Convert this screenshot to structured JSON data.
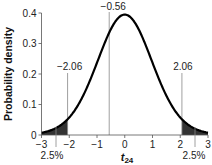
{
  "chart_data": {
    "type": "line",
    "title": "",
    "xlabel": "t",
    "xlabel_sub": "24",
    "ylabel": "Probability density",
    "xlim": [
      -3,
      3
    ],
    "ylim": [
      0,
      0.4
    ],
    "xticks": [
      -3,
      -2,
      -1,
      0,
      1,
      2,
      3
    ],
    "xtick_labels": [
      "−3",
      "−2",
      "−1",
      "0",
      "1",
      "2",
      "3"
    ],
    "yticks": [
      0,
      0.1,
      0.2,
      0.3,
      0.4
    ],
    "ytick_labels": [
      "0",
      "0.1",
      "0.2",
      "0.3",
      "0.4"
    ],
    "grid": false,
    "series": [
      {
        "name": "t distribution, df = 24",
        "distribution": "student-t",
        "df": 24
      }
    ],
    "shaded_regions": [
      {
        "from": -3,
        "to": -2.06,
        "label": "2.5%"
      },
      {
        "from": 2.06,
        "to": 3,
        "label": "2.5%"
      }
    ],
    "reference_lines": [
      {
        "x": -2.06,
        "label": "−2.06"
      },
      {
        "x": 2.06,
        "label": "2.06"
      },
      {
        "x": -0.56,
        "label": "−0.56"
      }
    ]
  }
}
